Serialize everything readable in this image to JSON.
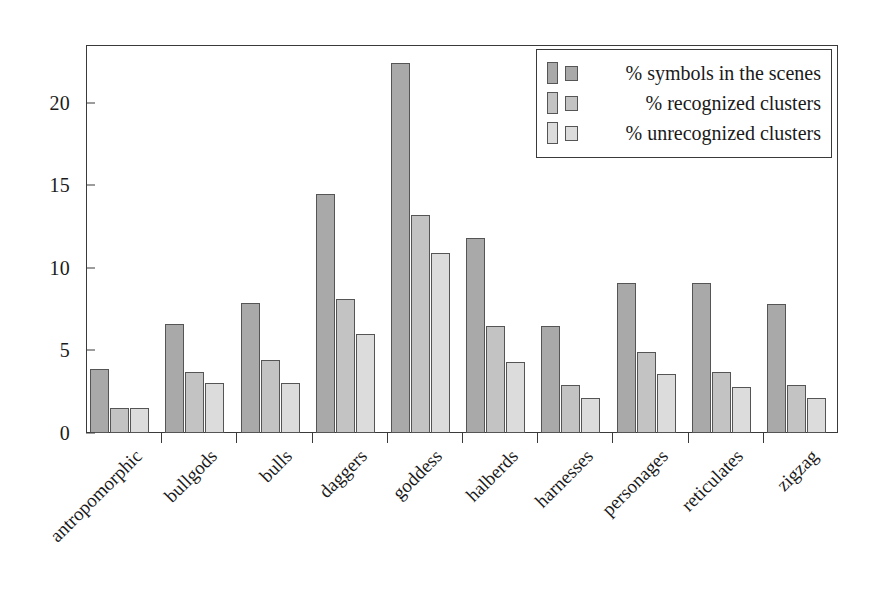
{
  "chart_data": {
    "type": "bar",
    "title": "",
    "xlabel": "",
    "ylabel": "",
    "ylim": [
      0,
      23.5
    ],
    "yticks": [
      0,
      5,
      10,
      15,
      20
    ],
    "ytick_labels": [
      "0",
      "5",
      "10",
      "15",
      "20"
    ],
    "grid": false,
    "legend_position": "top-right",
    "categories": [
      "antropomorphic",
      "bullgods",
      "bulls",
      "daggers",
      "goddess",
      "halberds",
      "harnesses",
      "personages",
      "reticulates",
      "zigzag"
    ],
    "series": [
      {
        "name": "% symbols in the scenes",
        "color": "#a9a9a9",
        "values": [
          3.9,
          6.6,
          7.9,
          14.5,
          22.4,
          11.8,
          6.5,
          9.1,
          9.1,
          7.8
        ]
      },
      {
        "name": "% recognized clusters",
        "color": "#c3c3c3",
        "values": [
          1.5,
          3.7,
          4.4,
          8.1,
          13.2,
          6.5,
          2.9,
          4.9,
          3.7,
          2.9
        ]
      },
      {
        "name": "% unrecognized clusters",
        "color": "#dcdcdc",
        "values": [
          1.5,
          3.0,
          3.0,
          6.0,
          10.9,
          4.3,
          2.1,
          3.6,
          2.8,
          2.1
        ]
      }
    ]
  },
  "legend": {
    "entries": [
      "% symbols in the scenes",
      "% recognized clusters",
      "% unrecognized clusters"
    ]
  },
  "colors": {
    "series_1": "#a9a9a9",
    "series_2": "#c3c3c3",
    "series_3": "#dcdcdc",
    "axis": "#3a3a3a",
    "background": "#ffffff"
  }
}
